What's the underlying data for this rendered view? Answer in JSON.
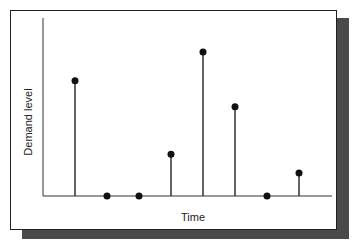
{
  "chart_data": {
    "type": "stem",
    "title": "",
    "xlabel": "Time",
    "ylabel": "Demand level",
    "x": [
      1,
      2,
      3,
      4,
      5,
      6,
      7,
      8
    ],
    "values": [
      0.8,
      0,
      0,
      0.29,
      1.0,
      0.62,
      0,
      0.16
    ],
    "ylim": [
      0,
      1.05
    ],
    "xlim": [
      0,
      8.8
    ],
    "grid": false,
    "legend": "none"
  },
  "colors": {
    "stem": "#111111",
    "axis": "#333333",
    "shadow": "#4a4a4a"
  }
}
